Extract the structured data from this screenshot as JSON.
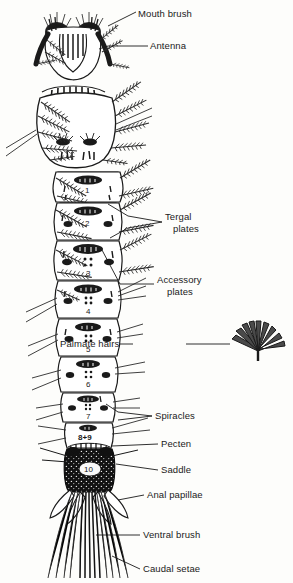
{
  "figure": {
    "background_color": "#fdfdfb",
    "ink_color": "#1a1a1a"
  },
  "labels": [
    {
      "name": "mouth-brush",
      "text": "Mouth brush",
      "x": 138,
      "y": 8,
      "leader": true
    },
    {
      "name": "antenna",
      "text": "Antenna",
      "x": 150,
      "y": 43,
      "leader": true
    },
    {
      "name": "tergal-plates",
      "text_line1": "Tergal",
      "text_line2": "plates",
      "x": 165,
      "y": 218,
      "leader": true
    },
    {
      "name": "accessory-plates",
      "text_line1": "Accessory",
      "text_line2": "plates",
      "x": 157,
      "y": 281,
      "leader": true
    },
    {
      "name": "palmate-hairs",
      "text_plain": "Palmate ",
      "text_bold": "hairs",
      "x": 133,
      "y": 340,
      "leader": true
    },
    {
      "name": "spiracles",
      "text": "Spiracles",
      "x": 155,
      "y": 412,
      "leader": true
    },
    {
      "name": "pecten",
      "text": "Pecten",
      "x": 161,
      "y": 441,
      "leader": true
    },
    {
      "name": "saddle",
      "text": "Saddle",
      "x": 161,
      "y": 467,
      "leader": true
    },
    {
      "name": "anal-papillae",
      "text": "Anal papillae",
      "x": 147,
      "y": 492,
      "leader": true
    },
    {
      "name": "ventral-brush",
      "text": "Ventral brush",
      "x": 143,
      "y": 532,
      "leader": true
    },
    {
      "name": "caudal-setae",
      "text": "Caudal setae",
      "x": 143,
      "y": 566,
      "leader": true
    }
  ],
  "segments": [
    {
      "name": "segment-1",
      "number": "1",
      "cx": 88,
      "cy": 189
    },
    {
      "name": "segment-2",
      "number": "2",
      "cx": 88,
      "cy": 222
    },
    {
      "name": "segment-3",
      "number": "3",
      "cx": 88,
      "cy": 262
    },
    {
      "name": "segment-4",
      "number": "4",
      "cx": 88,
      "cy": 303
    },
    {
      "name": "segment-5",
      "number": "5",
      "cx": 88,
      "cy": 342
    },
    {
      "name": "segment-6",
      "number": "6",
      "cx": 88,
      "cy": 377
    },
    {
      "name": "segment-7",
      "number": "7",
      "cx": 88,
      "cy": 410
    },
    {
      "name": "segment-8-9",
      "number": "8+9",
      "cx": 88,
      "cy": 434
    },
    {
      "name": "segment-10",
      "number": "10",
      "cx": 91,
      "cy": 469
    }
  ],
  "palmate_detail": {
    "name": "palmate-hair-detail",
    "cx": 258,
    "cy": 343
  }
}
